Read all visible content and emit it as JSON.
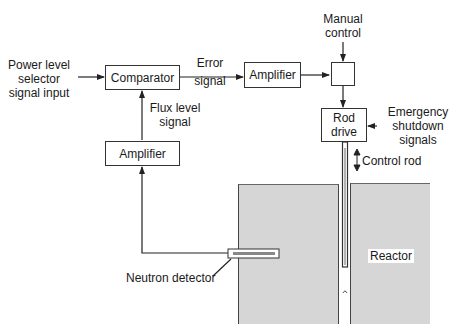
{
  "diagram": {
    "inputs": {
      "power_level": [
        "Power level",
        "selector",
        "signal input"
      ],
      "manual_control": [
        "Manual",
        "control"
      ],
      "emergency": [
        "Emergency",
        "shutdown",
        "signals"
      ]
    },
    "blocks": {
      "comparator": "Comparator",
      "amplifier_top": "Amplifier",
      "amplifier_feedback": "Amplifier",
      "rod_drive": [
        "Rod",
        "drive"
      ],
      "junction": ""
    },
    "signals": {
      "error": [
        "Error",
        "signal"
      ],
      "flux": [
        "Flux level",
        "signal"
      ]
    },
    "components": {
      "control_rod": "Control rod",
      "neutron_detector": "Neutron detector",
      "reactor": "Reactor"
    },
    "colors": {
      "line": "#333333",
      "reactor_fill": "#d6d6d6",
      "background": "#ffffff"
    }
  }
}
